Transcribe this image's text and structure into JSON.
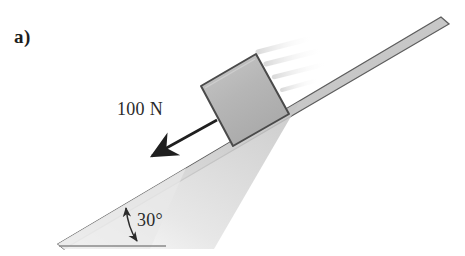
{
  "figure": {
    "part_label": "a)",
    "background_color": "#ffffff"
  },
  "annotations": {
    "force_label": "100 N",
    "angle_label": "30°"
  },
  "diagram": {
    "type": "free-body-inclined-plane",
    "incline_angle_degrees": 30,
    "force_magnitude_newtons": 100,
    "force_unit": "N",
    "force_direction": "down-the-slope",
    "block_fill_color": "#b9b9b9",
    "block_edge_color": "#4a4a4a",
    "ramp_fill_color": "#cfcfcf",
    "ramp_edge_color": "#5a5a5a",
    "arrow_color": "#1f1f1f",
    "baseline_color": "#8a8a8a"
  }
}
